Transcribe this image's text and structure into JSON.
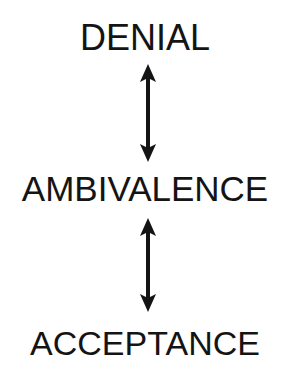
{
  "diagram": {
    "type": "vertical-flow",
    "stages": [
      {
        "label": "DENIAL"
      },
      {
        "label": "AMBIVALENCE"
      },
      {
        "label": "ACCEPTANCE"
      }
    ],
    "connections": [
      {
        "from": "DENIAL",
        "to": "AMBIVALENCE",
        "style": "double-headed-arrow"
      },
      {
        "from": "AMBIVALENCE",
        "to": "ACCEPTANCE",
        "style": "double-headed-arrow"
      }
    ],
    "colors": {
      "text": "#141414",
      "arrow": "#141414",
      "background": "#ffffff"
    }
  }
}
